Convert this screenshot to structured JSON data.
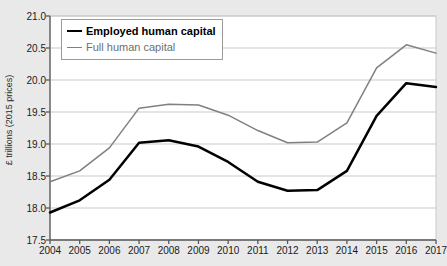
{
  "chart_data": {
    "type": "line",
    "title": "",
    "xlabel": "",
    "ylabel": "£ trillions (2015 prices)",
    "categories": [
      "2004",
      "2005",
      "2006",
      "2007",
      "2008",
      "2009",
      "2010",
      "2011",
      "2012",
      "2013",
      "2014",
      "2015",
      "2016",
      "2017"
    ],
    "x": [
      2004,
      2005,
      2006,
      2007,
      2008,
      2009,
      2010,
      2011,
      2012,
      2013,
      2014,
      2015,
      2016,
      2017
    ],
    "ylim": [
      17.5,
      21.0
    ],
    "xlim": [
      2004,
      2017
    ],
    "yticks": [
      "17.5",
      "18.0",
      "18.5",
      "19.0",
      "19.5",
      "20.0",
      "20.5",
      "21.0"
    ],
    "ytick_values": [
      17.5,
      18.0,
      18.5,
      19.0,
      19.5,
      20.0,
      20.5,
      21.0
    ],
    "grid": true,
    "grid_axis": "y",
    "legend_position": "top-left",
    "series": [
      {
        "name": "Employed human capital",
        "color": "#000000",
        "width": 2.5,
        "values": [
          17.93,
          18.12,
          18.44,
          19.02,
          19.06,
          18.96,
          18.72,
          18.41,
          18.27,
          18.28,
          18.58,
          19.44,
          19.95,
          19.89
        ]
      },
      {
        "name": "Full human capital",
        "color": "#808080",
        "width": 1.5,
        "values": [
          18.41,
          18.58,
          18.94,
          19.56,
          19.62,
          19.61,
          19.45,
          19.21,
          19.02,
          19.03,
          19.33,
          20.19,
          20.55,
          20.42
        ]
      }
    ]
  },
  "legend": {
    "items": [
      {
        "label": "Employed human capital",
        "swatch": "thick-black-line"
      },
      {
        "label": "Full human capital",
        "swatch": "thin-gray-line"
      }
    ]
  },
  "colors": {
    "background": "#e9e9e9",
    "plot_background": "#ffffff",
    "gridline": "#c9c9c9",
    "axis": "#595959",
    "series_employed": "#000000",
    "series_full": "#808080"
  }
}
